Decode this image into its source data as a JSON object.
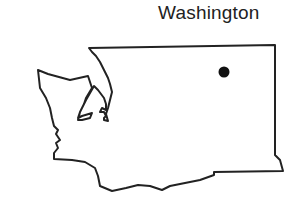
{
  "map": {
    "title": "Washington",
    "region": "Washington state outline",
    "outline_color": "#222222",
    "fill_color": "#ffffff",
    "markers": [
      {
        "name": "location-dot",
        "x": 224,
        "y": 72,
        "r": 5.5,
        "color": "#111111"
      }
    ]
  }
}
